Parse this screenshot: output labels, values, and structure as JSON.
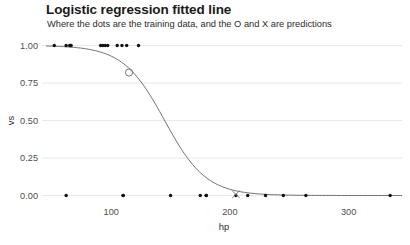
{
  "chart": {
    "title": "Logistic regression fitted line",
    "subtitle": "Where the dots are the training data, and the O and X are predictions"
  },
  "chart_data": {
    "type": "scatter",
    "title": "Logistic regression fitted line",
    "subtitle": "Where the dots are the training data, and the O and X are predictions",
    "xlabel": "hp",
    "ylabel": "vs",
    "xlim": [
      45,
      345
    ],
    "ylim": [
      -0.03,
      1.03
    ],
    "grid": true,
    "legend": false,
    "xticks": [
      100,
      200,
      300
    ],
    "xtick_labels": [
      "100",
      "200",
      "300"
    ],
    "yticks": [
      0.0,
      0.25,
      0.5,
      0.75,
      1.0
    ],
    "ytick_labels": [
      "0.00",
      "0.25",
      "0.50",
      "0.75",
      "1.00"
    ],
    "series": [
      {
        "name": "training data",
        "type": "scatter",
        "marker": "dot",
        "color": "#111111",
        "points": [
          [
            52,
            1
          ],
          [
            62,
            1
          ],
          [
            65,
            1
          ],
          [
            66,
            1
          ],
          [
            66,
            1
          ],
          [
            91,
            1
          ],
          [
            93,
            1
          ],
          [
            95,
            1
          ],
          [
            97,
            1
          ],
          [
            105,
            1
          ],
          [
            109,
            1
          ],
          [
            113,
            1
          ],
          [
            123,
            1
          ],
          [
            62,
            0
          ],
          [
            110,
            0
          ],
          [
            110,
            0
          ],
          [
            150,
            0
          ],
          [
            175,
            0
          ],
          [
            180,
            0
          ],
          [
            180,
            0
          ],
          [
            205,
            0
          ],
          [
            215,
            0
          ],
          [
            230,
            0
          ],
          [
            245,
            0
          ],
          [
            264,
            0
          ],
          [
            335,
            0
          ]
        ]
      },
      {
        "name": "fitted logistic curve",
        "type": "line",
        "color": "#555555",
        "curve": {
          "form": "1 / (1 + exp((x - x0) / k))",
          "x0": 145,
          "k": 17.5,
          "x_range": [
            45,
            345
          ]
        }
      },
      {
        "name": "prediction O",
        "type": "scatter",
        "marker": "circle-open",
        "color": "#666666",
        "points": [
          [
            115,
            0.82
          ]
        ]
      },
      {
        "name": "prediction X",
        "type": "scatter",
        "marker": "x",
        "color": "#777777",
        "points": [
          [
            205,
            0.008
          ]
        ]
      }
    ]
  }
}
